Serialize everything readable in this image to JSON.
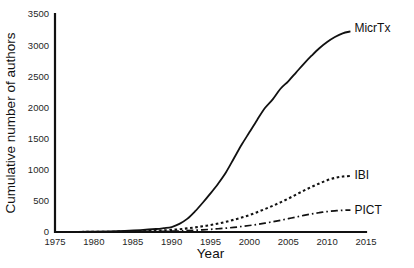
{
  "chart_data": {
    "type": "line",
    "title": "",
    "xlabel": "Year",
    "ylabel": "Cumulative number of authors",
    "xlim": [
      1975,
      2015
    ],
    "ylim": [
      0,
      3500
    ],
    "xticks": [
      1975,
      1980,
      1985,
      1990,
      1995,
      2000,
      2005,
      2010,
      2015
    ],
    "yticks": [
      0,
      500,
      1000,
      1500,
      2000,
      2500,
      3000,
      3500
    ],
    "grid": false,
    "legend_position": "line-end-labels",
    "x": [
      1975,
      1978,
      1980,
      1982,
      1984,
      1986,
      1988,
      1989,
      1990,
      1991,
      1992,
      1993,
      1994,
      1995,
      1996,
      1997,
      1998,
      1999,
      2000,
      2001,
      2002,
      2003,
      2004,
      2005,
      2006,
      2007,
      2008,
      2009,
      2010,
      2011,
      2012,
      2013
    ],
    "series": [
      {
        "name": "MicrTx",
        "style": "solid",
        "values": [
          0,
          2,
          5,
          10,
          18,
          30,
          48,
          62,
          80,
          130,
          210,
          330,
          470,
          620,
          780,
          960,
          1180,
          1400,
          1600,
          1800,
          1990,
          2130,
          2300,
          2420,
          2560,
          2700,
          2830,
          2950,
          3050,
          3130,
          3190,
          3220
        ]
      },
      {
        "name": "IBI",
        "style": "dotted",
        "values": [
          0,
          1,
          2,
          4,
          7,
          12,
          20,
          26,
          34,
          44,
          58,
          74,
          92,
          112,
          136,
          164,
          196,
          232,
          272,
          318,
          368,
          420,
          476,
          536,
          600,
          664,
          724,
          780,
          830,
          868,
          890,
          900
        ]
      },
      {
        "name": "PICT",
        "style": "dashdot",
        "values": [
          0,
          1,
          1,
          2,
          3,
          5,
          8,
          10,
          13,
          17,
          22,
          28,
          35,
          43,
          52,
          62,
          74,
          88,
          104,
          122,
          142,
          164,
          188,
          214,
          240,
          266,
          290,
          310,
          328,
          340,
          348,
          352
        ]
      }
    ]
  },
  "plot_geometry": {
    "left": 55,
    "right": 366,
    "top": 14,
    "bottom": 232
  },
  "axis_titles": {
    "x": "Year",
    "y": "Cumulative number of authors"
  }
}
